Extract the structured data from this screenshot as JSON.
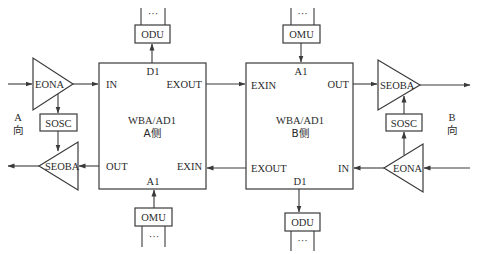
{
  "diagram": {
    "side_labels": {
      "left": {
        "letter": "A",
        "direction": "向"
      },
      "right": {
        "letter": "B",
        "direction": "向"
      }
    },
    "main_blocks": {
      "a_side": {
        "title": "WBA/AD1",
        "subtitle": "A侧",
        "ports": {
          "top": "D1",
          "in": "IN",
          "exout": "EXOUT",
          "out": "OUT",
          "exin": "EXIN",
          "bottom": "A1"
        }
      },
      "b_side": {
        "title": "WBA/AD1",
        "subtitle": "B侧",
        "ports": {
          "top": "A1",
          "exin": "EXIN",
          "out": "OUT",
          "exout": "EXOUT",
          "in": "IN",
          "bottom": "D1"
        }
      }
    },
    "units": {
      "odu_top": "ODU",
      "omu_top": "OMU",
      "omu_bottom": "OMU",
      "odu_bottom": "ODU",
      "ellipsis": "···"
    },
    "amplifiers": {
      "left_eona": "EONA",
      "left_seoba": "SEOBA",
      "right_seoba": "SEOBA",
      "right_eona": "EONA"
    },
    "supervisory": {
      "left_sosc": "SOSC",
      "right_sosc": "SOSC"
    },
    "colors": {
      "line": "#3a3a3a",
      "text": "#2a2a2a",
      "background": "#ffffff"
    }
  }
}
